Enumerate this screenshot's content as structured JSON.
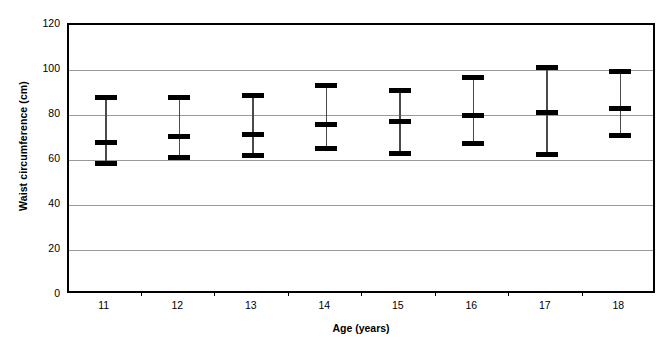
{
  "chart_data": {
    "type": "line",
    "title": "",
    "subtitle": "",
    "xlabel": "Age (years)",
    "ylabel": "Waist circumference (cm)",
    "categories": [
      "11",
      "12",
      "13",
      "14",
      "15",
      "16",
      "17",
      "18"
    ],
    "x": [
      11,
      12,
      13,
      14,
      15,
      16,
      17,
      18
    ],
    "xlim": [
      10.5,
      18.5
    ],
    "ylim": [
      0,
      120
    ],
    "y_ticks": [
      0,
      20,
      40,
      60,
      80,
      100,
      120
    ],
    "y_tick_labels": [
      "0",
      "20",
      "40",
      "60",
      "80",
      "100",
      "120"
    ],
    "grid": true,
    "grid_axis": "y",
    "legend": "none",
    "marker_style": "horizontal-bar",
    "series": [
      {
        "name": "Mean waist circumference",
        "values": [
          68,
          70.5,
          71.5,
          76,
          77,
          80,
          81,
          83
        ]
      },
      {
        "name": "Upper value",
        "values": [
          88,
          88,
          88.5,
          93,
          91,
          96.5,
          101,
          99.5
        ]
      },
      {
        "name": "Lower value",
        "values": [
          58.5,
          61,
          62,
          65,
          63,
          67.5,
          62.5,
          71
        ]
      }
    ],
    "points": [
      {
        "age": "11",
        "mean": 68,
        "upper": 88,
        "lower": 58.5
      },
      {
        "age": "12",
        "mean": 70.5,
        "upper": 88,
        "lower": 61
      },
      {
        "age": "13",
        "mean": 71.5,
        "upper": 88.5,
        "lower": 62
      },
      {
        "age": "14",
        "mean": 76,
        "upper": 93,
        "lower": 65
      },
      {
        "age": "15",
        "mean": 77,
        "upper": 91,
        "lower": 63
      },
      {
        "age": "16",
        "mean": 80,
        "upper": 96.5,
        "lower": 67.5
      },
      {
        "age": "17",
        "mean": 81,
        "upper": 101,
        "lower": 62.5
      },
      {
        "age": "18",
        "mean": 83,
        "upper": 99.5,
        "lower": 71
      }
    ],
    "colors": {
      "marker": "#000000",
      "whisker": "#4a4a4a",
      "gridline": "#9a9a9a",
      "axis": "#000000",
      "background": "#ffffff"
    }
  }
}
